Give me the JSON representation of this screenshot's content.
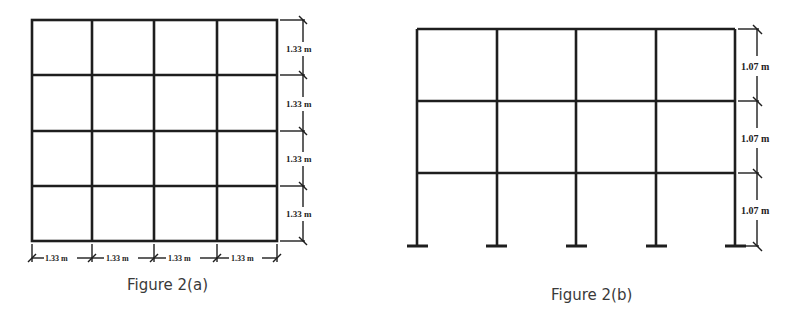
{
  "figure_a": {
    "caption": "Figure 2(a)",
    "description": "4x4 square grid mesh",
    "rows": 4,
    "columns": 4,
    "vertical_dimensions": [
      "1.33 m",
      "1.33 m",
      "1.33 m",
      "1.33 m"
    ],
    "horizontal_dimensions": [
      "1.33 m",
      "1.33 m",
      "1.33 m",
      "1.33 m"
    ]
  },
  "figure_b": {
    "caption": "Figure 2(b)",
    "description": "3-storey, 4-bay frame with fixed supports",
    "storeys": 3,
    "bays": 4,
    "supports": 5,
    "vertical_dimensions": [
      "1.07 m",
      "1.07 m",
      "1.07 m"
    ]
  },
  "colors": {
    "line": "#1e1e1e",
    "caption": "#3a3a3a",
    "background": "#ffffff"
  }
}
